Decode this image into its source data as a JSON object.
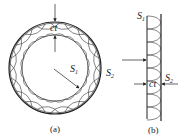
{
  "figure": {
    "panel_a": {
      "caption": "(a)",
      "labels": {
        "inner_surface": "S",
        "inner_sub": "1",
        "outer_surface": "S",
        "outer_sub": "2",
        "thickness": "ct"
      },
      "scallop_count": 20
    },
    "panel_b": {
      "caption": "(b)",
      "labels": {
        "inner_surface": "S",
        "inner_sub": "1",
        "outer_surface": "S",
        "outer_sub": "2",
        "thickness": "ct"
      },
      "scallop_count": 8
    },
    "colors": {
      "stroke": "#222222",
      "background": "#ffffff"
    }
  }
}
